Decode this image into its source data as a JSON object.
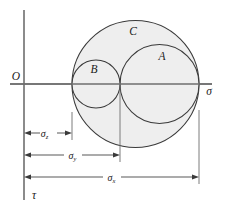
{
  "figure": {
    "name": "mohr-circles-triaxial-stress-diagram",
    "background_color": "#ffffff",
    "fill_color": "#eeeeee",
    "outline_color": "#3a3a3a",
    "axis_color": "#6e6e6e"
  },
  "axes": {
    "origin_label": "O",
    "horizontal_label": "σ",
    "vertical_label": "τ"
  },
  "circles": [
    {
      "id": "C",
      "label": "C",
      "left_value": "σz",
      "right_value": "σx",
      "cx": 135.5,
      "cy": 84,
      "r": 63.5,
      "label_x": 133,
      "label_y": 35
    },
    {
      "id": "A",
      "label": "A",
      "left_value": "σy",
      "right_value": "σx",
      "cx": 159.5,
      "cy": 84,
      "r": 39.5,
      "label_x": 162,
      "label_y": 60
    },
    {
      "id": "B",
      "label": "B",
      "left_value": "σz",
      "right_value": "σy",
      "cx": 96,
      "cy": 84,
      "r": 24,
      "label_x": 94,
      "label_y": 73
    }
  ],
  "dimensions": [
    {
      "id": "sigma-z",
      "symbol": "σ",
      "subscript": "z",
      "start_x": 24,
      "end_x": 72,
      "y": 133,
      "label_x": 48,
      "label_y": 136
    },
    {
      "id": "sigma-y",
      "symbol": "σ",
      "subscript": "y",
      "start_x": 24,
      "end_x": 120,
      "y": 155,
      "label_x": 72,
      "label_y": 158
    },
    {
      "id": "sigma-x",
      "symbol": "σ",
      "subscript": "x",
      "start_x": 24,
      "end_x": 199,
      "y": 177,
      "label_x": 111,
      "label_y": 180
    }
  ],
  "extension_lines": [
    {
      "id": "ext-sigma-z",
      "x": 72,
      "y_top": 112,
      "y_bottom": 140
    },
    {
      "id": "ext-sigma-y",
      "x": 120,
      "y_top": 84,
      "y_bottom": 162
    },
    {
      "id": "ext-sigma-x",
      "x": 199,
      "y_top": 110,
      "y_bottom": 184
    }
  ]
}
